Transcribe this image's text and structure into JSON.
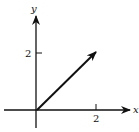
{
  "diagram": {
    "type": "vector-plot",
    "axes": {
      "x_label": "x",
      "y_label": "y",
      "x_tick_label": "2",
      "y_tick_label": "2"
    },
    "vector": {
      "from": [
        0,
        0
      ],
      "to": [
        2,
        2
      ]
    },
    "colors": {
      "ink": "#111111",
      "background": "#ffffff"
    }
  }
}
